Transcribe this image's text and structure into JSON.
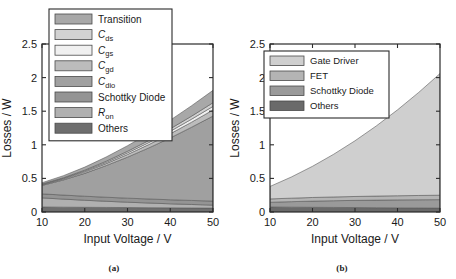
{
  "figure": {
    "panels": [
      {
        "id": "a",
        "caption": "(a)",
        "xlabel": "Input Voltage / V",
        "ylabel": "Losses / W",
        "xticks": [
          "10",
          "20",
          "30",
          "40",
          "50"
        ],
        "yticks": [
          "0",
          "0.5",
          "1",
          "1.5",
          "2",
          "2.5"
        ],
        "legend": [
          {
            "label": "Transition",
            "sub": "",
            "color": "#a8a8a8"
          },
          {
            "label": "C",
            "sub": "ds",
            "color": "#d2d2d2"
          },
          {
            "label": "C",
            "sub": "gs",
            "color": "#f0f0f0"
          },
          {
            "label": "C",
            "sub": "gd",
            "color": "#bcbcbc"
          },
          {
            "label": "C",
            "sub": "dio",
            "color": "#a0a0a0"
          },
          {
            "label": "Schottky Diode",
            "sub": "",
            "color": "#949494"
          },
          {
            "label": "R",
            "sub": "on",
            "color": "#b0b0b0"
          },
          {
            "label": "Others",
            "sub": "",
            "color": "#6e6e6e"
          }
        ]
      },
      {
        "id": "b",
        "caption": "(b)",
        "xlabel": "Input Voltage / V",
        "ylabel": "Losses / W",
        "xticks": [
          "10",
          "20",
          "30",
          "40",
          "50"
        ],
        "yticks": [
          "0",
          "0.5",
          "1",
          "1.5",
          "2",
          "2.5"
        ],
        "legend": [
          {
            "label": "Gate Driver",
            "sub": "",
            "color": "#cfcfcf"
          },
          {
            "label": "FET",
            "sub": "",
            "color": "#b4b4b4"
          },
          {
            "label": "Schottky Diode",
            "sub": "",
            "color": "#9a9a9a"
          },
          {
            "label": "Others",
            "sub": "",
            "color": "#6a6a6a"
          }
        ]
      }
    ]
  },
  "chart_data": [
    {
      "type": "area",
      "panel": "a",
      "title": "",
      "xlabel": "Input Voltage / V",
      "ylabel": "Losses / W",
      "xlim": [
        10,
        50
      ],
      "ylim": [
        0,
        2.5
      ],
      "grid": false,
      "legend_position": "upper-left",
      "stacked": true,
      "x": [
        10,
        15,
        20,
        25,
        30,
        35,
        40,
        45,
        50
      ],
      "series": [
        {
          "name": "Others",
          "color": "#6e6e6e",
          "values": [
            0.075,
            0.072,
            0.07,
            0.068,
            0.066,
            0.064,
            0.062,
            0.06,
            0.058
          ]
        },
        {
          "name": "Ron",
          "color": "#b0b0b0",
          "values": [
            0.135,
            0.12,
            0.105,
            0.092,
            0.08,
            0.07,
            0.06,
            0.052,
            0.045
          ]
        },
        {
          "name": "Schottky Diode",
          "color": "#949494",
          "values": [
            0.06,
            0.06,
            0.06,
            0.06,
            0.06,
            0.06,
            0.06,
            0.06,
            0.06
          ]
        },
        {
          "name": "Cdio",
          "color": "#a0a0a0",
          "values": [
            0.125,
            0.225,
            0.34,
            0.47,
            0.61,
            0.76,
            0.92,
            1.09,
            1.265
          ]
        },
        {
          "name": "Cgd",
          "color": "#bcbcbc",
          "values": [
            0.01,
            0.015,
            0.022,
            0.03,
            0.04,
            0.05,
            0.062,
            0.075,
            0.09
          ]
        },
        {
          "name": "Cgs",
          "color": "#f0f0f0",
          "values": [
            0.006,
            0.009,
            0.013,
            0.018,
            0.024,
            0.03,
            0.037,
            0.045,
            0.054
          ]
        },
        {
          "name": "Cds",
          "color": "#d2d2d2",
          "values": [
            0.006,
            0.009,
            0.013,
            0.018,
            0.024,
            0.03,
            0.037,
            0.045,
            0.054
          ]
        },
        {
          "name": "Transition",
          "color": "#a8a8a8",
          "values": [
            0.018,
            0.03,
            0.045,
            0.062,
            0.082,
            0.104,
            0.128,
            0.155,
            0.184
          ]
        }
      ]
    },
    {
      "type": "area",
      "panel": "b",
      "title": "",
      "xlabel": "Input Voltage / V",
      "ylabel": "Losses / W",
      "xlim": [
        10,
        50
      ],
      "ylim": [
        0,
        2.5
      ],
      "grid": false,
      "legend_position": "upper-left",
      "stacked": true,
      "x": [
        10,
        15,
        20,
        25,
        30,
        35,
        40,
        45,
        50
      ],
      "series": [
        {
          "name": "Others",
          "color": "#6a6a6a",
          "values": [
            0.075,
            0.072,
            0.07,
            0.068,
            0.066,
            0.064,
            0.062,
            0.06,
            0.058
          ]
        },
        {
          "name": "Schottky Diode",
          "color": "#9a9a9a",
          "values": [
            0.07,
            0.082,
            0.092,
            0.1,
            0.107,
            0.113,
            0.118,
            0.122,
            0.126
          ]
        },
        {
          "name": "FET",
          "color": "#b4b4b4",
          "values": [
            0.05,
            0.052,
            0.054,
            0.056,
            0.058,
            0.06,
            0.062,
            0.064,
            0.066
          ]
        },
        {
          "name": "Gate Driver",
          "color": "#cfcfcf",
          "values": [
            0.185,
            0.314,
            0.464,
            0.636,
            0.829,
            1.043,
            1.278,
            1.534,
            1.81
          ]
        }
      ]
    }
  ]
}
